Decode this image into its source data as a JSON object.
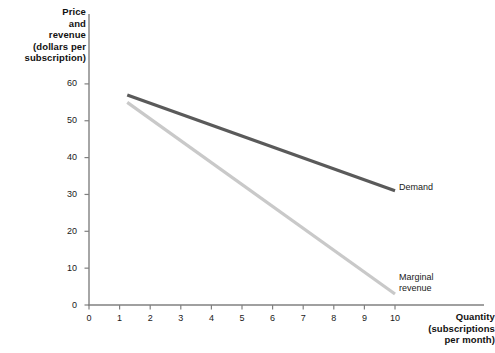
{
  "chart_data": {
    "type": "line",
    "title": "",
    "xlabel": "Quantity\n(subscriptions\nper month)",
    "ylabel": "Price\nand\nrevenue\n(dollars per\nsubscription)",
    "xlim": [
      0,
      10.6
    ],
    "ylim": [
      0,
      62
    ],
    "grid": false,
    "legend_position": "inline-right",
    "xticks": [
      "0",
      "1",
      "2",
      "3",
      "4",
      "5",
      "6",
      "7",
      "8",
      "9",
      "10"
    ],
    "xtick_values": [
      0,
      1,
      2,
      3,
      4,
      5,
      6,
      7,
      8,
      9,
      10
    ],
    "yticks": [
      "0",
      "10",
      "20",
      "30",
      "40",
      "50",
      "60"
    ],
    "ytick_values": [
      0,
      10,
      20,
      30,
      40,
      50,
      60
    ],
    "series": [
      {
        "name": "Demand",
        "color": "#5a5a5a",
        "width": 3.2,
        "x": [
          1.25,
          10
        ],
        "values": [
          57,
          31
        ]
      },
      {
        "name": "Marginal revenue",
        "color": "#c9c9c9",
        "width": 3.2,
        "x": [
          1.25,
          10
        ],
        "values": [
          55,
          3
        ]
      }
    ],
    "annotations": [
      {
        "text": "Demand",
        "x": 10.15,
        "y": 31
      },
      {
        "text": "Marginal\nrevenue",
        "x": 10.15,
        "y": 6
      }
    ]
  },
  "axes": {
    "axis_color": "#808080",
    "tick_color": "#808080",
    "background": "#ffffff"
  }
}
